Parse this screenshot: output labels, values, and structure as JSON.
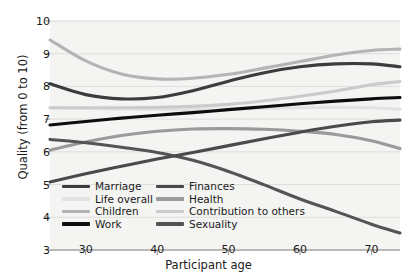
{
  "chart_data": {
    "type": "line",
    "title": "",
    "xlabel": "Participant age",
    "ylabel": "Quality (from 0 to 10)",
    "xlim": [
      25,
      74
    ],
    "ylim": [
      3,
      10
    ],
    "xticks": [
      30,
      40,
      50,
      60,
      70
    ],
    "yticks": [
      3,
      4,
      5,
      6,
      7,
      8,
      9,
      10
    ],
    "grid": "horizontal",
    "legend_position": "lower-left-inside",
    "legend_columns": 2,
    "x": [
      25,
      30,
      35,
      40,
      45,
      50,
      55,
      60,
      65,
      70,
      74
    ],
    "series": [
      {
        "name": "Marriage",
        "color": "#3c3c3c",
        "width": 3.1,
        "values": [
          8.08,
          7.75,
          7.62,
          7.66,
          7.87,
          8.16,
          8.42,
          8.6,
          8.69,
          8.69,
          8.6
        ]
      },
      {
        "name": "Life overall",
        "color": "#e2e2e2",
        "width": 3.1,
        "values": [
          7.35,
          7.33,
          7.31,
          7.3,
          7.3,
          7.31,
          7.33,
          7.35,
          7.36,
          7.35,
          7.3
        ]
      },
      {
        "name": "Children",
        "color": "#b4b4b4",
        "width": 3.1,
        "values": [
          9.42,
          8.78,
          8.38,
          8.23,
          8.25,
          8.37,
          8.56,
          8.76,
          8.96,
          9.1,
          9.14
        ]
      },
      {
        "name": "Work",
        "color": "#0d0d0d",
        "width": 3.1,
        "values": [
          6.82,
          6.93,
          7.03,
          7.12,
          7.2,
          7.29,
          7.38,
          7.47,
          7.55,
          7.62,
          7.66
        ]
      },
      {
        "name": "Finances",
        "color": "#4a4a4a",
        "width": 3.1,
        "values": [
          5.08,
          5.33,
          5.56,
          5.78,
          5.98,
          6.19,
          6.4,
          6.6,
          6.78,
          6.92,
          6.97
        ]
      },
      {
        "name": "Health",
        "color": "#9a9a9a",
        "width": 3.1,
        "values": [
          6.05,
          6.3,
          6.5,
          6.63,
          6.7,
          6.71,
          6.69,
          6.63,
          6.53,
          6.34,
          6.1
        ]
      },
      {
        "name": "Contribution to others",
        "color": "#cbcbcb",
        "width": 3.1,
        "values": [
          7.35,
          7.35,
          7.35,
          7.36,
          7.39,
          7.45,
          7.56,
          7.7,
          7.86,
          8.05,
          8.15
        ]
      },
      {
        "name": "Sexuality",
        "color": "#545454",
        "width": 3.1,
        "values": [
          6.38,
          6.28,
          6.14,
          5.98,
          5.74,
          5.4,
          4.99,
          4.56,
          4.18,
          3.79,
          3.52
        ]
      }
    ]
  },
  "axes": {
    "y_title": "Quality (from 0 to 10)",
    "x_title": "Participant age",
    "y_tick_labels": [
      "10",
      "9",
      "8",
      "7",
      "6",
      "5",
      "4",
      "3"
    ],
    "x_tick_labels": [
      "30",
      "40",
      "50",
      "60",
      "70"
    ]
  },
  "legend": {
    "entries": [
      {
        "label": "Marriage",
        "color": "#3c3c3c"
      },
      {
        "label": "Finances",
        "color": "#4a4a4a"
      },
      {
        "label": "Life overall",
        "color": "#e2e2e2"
      },
      {
        "label": "Health",
        "color": "#9a9a9a"
      },
      {
        "label": "Children",
        "color": "#b4b4b4"
      },
      {
        "label": "Contribution to others",
        "color": "#cbcbcb"
      },
      {
        "label": "Work",
        "color": "#0d0d0d"
      },
      {
        "label": "Sexuality",
        "color": "#545454"
      }
    ]
  },
  "style": {
    "plot_background": "#f4f4f2",
    "gridline_color": "#d8d8d6",
    "axis_color": "#8a8a8a",
    "text_color": "#1a1a1a"
  }
}
